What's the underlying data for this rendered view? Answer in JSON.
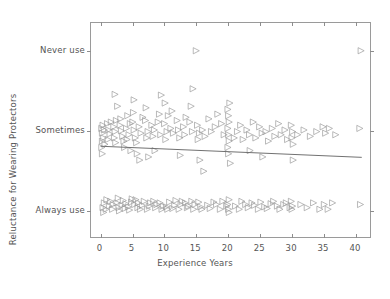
{
  "chart_data": {
    "type": "scatter",
    "title": "",
    "xlabel": "Experience Years",
    "ylabel": "Reluctance for Wearing Protectors",
    "xlim": [
      -1.5,
      42.5
    ],
    "ylim": [
      -0.35,
      2.35
    ],
    "xticks": [
      0,
      5,
      10,
      15,
      20,
      25,
      30,
      35,
      40
    ],
    "xticklabels": [
      "0",
      "5",
      "10",
      "15",
      "20",
      "25",
      "30",
      "35",
      "40"
    ],
    "yticks": [
      0,
      1,
      2
    ],
    "yticklabels": [
      "Always use",
      "Sometimes",
      "Never use"
    ],
    "grid": false,
    "legend": null,
    "marker": "right-triangle-open",
    "marker_color": "#9b9b9b",
    "marker_size": 6,
    "jitter": true,
    "fit_line": {
      "name": "linear regression",
      "color": "#6f6f6f",
      "x_start": 0,
      "x_end": 41.2,
      "y_start": 0.795,
      "y_end": 0.655,
      "slope": -0.0034,
      "intercept": 0.795
    },
    "points": [
      [
        0.1,
        1.02
      ],
      [
        0.2,
        0.96
      ],
      [
        0.3,
        1.06
      ],
      [
        0.4,
        0.9
      ],
      [
        0.5,
        1.0
      ],
      [
        0.2,
        0.86
      ],
      [
        0.6,
        0.82
      ],
      [
        0.1,
        0.78
      ],
      [
        0.5,
        0.08
      ],
      [
        0.3,
        0.02
      ],
      [
        0.8,
        0.0
      ],
      [
        0.4,
        -0.04
      ],
      [
        0.9,
        0.12
      ],
      [
        0.2,
        0.7
      ],
      [
        1.0,
        1.08
      ],
      [
        1.2,
        1.0
      ],
      [
        1.4,
        0.95
      ],
      [
        1.1,
        0.88
      ],
      [
        1.6,
        1.1
      ],
      [
        1.3,
        0.04
      ],
      [
        1.8,
        0.0
      ],
      [
        1.5,
        0.1
      ],
      [
        1.9,
        0.06
      ],
      [
        2.0,
        1.04
      ],
      [
        2.2,
        0.98
      ],
      [
        2.4,
        1.12
      ],
      [
        2.1,
        0.9
      ],
      [
        2.6,
        1.3
      ],
      [
        2.3,
        0.84
      ],
      [
        2.8,
        0.02
      ],
      [
        2.5,
        0.08
      ],
      [
        2.9,
        -0.02
      ],
      [
        2.7,
        0.14
      ],
      [
        2.2,
        1.45
      ],
      [
        3.0,
        1.06
      ],
      [
        3.2,
        0.99
      ],
      [
        3.4,
        0.92
      ],
      [
        3.1,
        1.14
      ],
      [
        3.6,
        0.86
      ],
      [
        3.3,
        0.05
      ],
      [
        3.8,
        0.01
      ],
      [
        3.5,
        0.11
      ],
      [
        3.9,
        0.07
      ],
      [
        3.7,
        0.78
      ],
      [
        4.0,
        1.02
      ],
      [
        4.2,
        1.18
      ],
      [
        4.4,
        0.94
      ],
      [
        4.1,
        0.88
      ],
      [
        4.6,
        1.08
      ],
      [
        4.3,
        0.03
      ],
      [
        4.8,
        0.09
      ],
      [
        4.5,
        -0.01
      ],
      [
        4.9,
        0.13
      ],
      [
        4.7,
        0.74
      ],
      [
        5.0,
        1.1
      ],
      [
        5.2,
        1.0
      ],
      [
        5.4,
        0.9
      ],
      [
        5.1,
        1.22
      ],
      [
        5.6,
        0.84
      ],
      [
        5.3,
        0.06
      ],
      [
        5.8,
        0.02
      ],
      [
        5.5,
        0.12
      ],
      [
        5.9,
        0.08
      ],
      [
        5.7,
        0.7
      ],
      [
        5.2,
        1.38
      ],
      [
        6.0,
        1.04
      ],
      [
        6.3,
        0.96
      ],
      [
        6.6,
        1.16
      ],
      [
        6.2,
        0.0
      ],
      [
        6.8,
        0.1
      ],
      [
        6.5,
        0.05
      ],
      [
        6.1,
        0.62
      ],
      [
        7.0,
        1.12
      ],
      [
        7.4,
        0.98
      ],
      [
        7.2,
        0.9
      ],
      [
        7.6,
        0.04
      ],
      [
        7.3,
        0.0
      ],
      [
        7.8,
        0.08
      ],
      [
        7.5,
        0.66
      ],
      [
        7.1,
        1.28
      ],
      [
        8.0,
        1.06
      ],
      [
        8.4,
        1.0
      ],
      [
        8.2,
        0.92
      ],
      [
        8.6,
        0.02
      ],
      [
        8.3,
        0.1
      ],
      [
        8.8,
        0.06
      ],
      [
        8.5,
        0.74
      ],
      [
        9.0,
        1.1
      ],
      [
        9.4,
        0.94
      ],
      [
        9.2,
        1.2
      ],
      [
        9.6,
        0.0
      ],
      [
        9.3,
        0.08
      ],
      [
        9.8,
        0.04
      ],
      [
        9.5,
        1.44
      ],
      [
        10.0,
        1.08
      ],
      [
        10.4,
        0.98
      ],
      [
        10.2,
        0.88
      ],
      [
        10.6,
        1.18
      ],
      [
        10.3,
        0.03
      ],
      [
        10.8,
        0.09
      ],
      [
        10.5,
        0.0
      ],
      [
        10.1,
        1.34
      ],
      [
        11.0,
        1.02
      ],
      [
        11.4,
        0.96
      ],
      [
        11.2,
        1.24
      ],
      [
        11.6,
        0.05
      ],
      [
        11.3,
        0.01
      ],
      [
        11.8,
        0.11
      ],
      [
        12.0,
        1.12
      ],
      [
        12.4,
        0.9
      ],
      [
        12.2,
        1.0
      ],
      [
        12.6,
        0.06
      ],
      [
        12.3,
        0.0
      ],
      [
        12.8,
        0.1
      ],
      [
        12.5,
        0.68
      ],
      [
        13.0,
        1.04
      ],
      [
        13.4,
        1.16
      ],
      [
        13.2,
        0.94
      ],
      [
        13.6,
        0.02
      ],
      [
        13.3,
        0.08
      ],
      [
        13.8,
        0.04
      ],
      [
        14.0,
        1.1
      ],
      [
        14.4,
        0.98
      ],
      [
        14.2,
        1.3
      ],
      [
        14.6,
        0.0
      ],
      [
        14.3,
        0.1
      ],
      [
        14.8,
        0.06
      ],
      [
        14.5,
        1.52
      ],
      [
        15.0,
        2.0
      ],
      [
        15.2,
        1.06
      ],
      [
        15.5,
        0.96
      ],
      [
        15.3,
        0.88
      ],
      [
        15.7,
        0.03
      ],
      [
        15.4,
        0.09
      ],
      [
        15.9,
        0.0
      ],
      [
        15.6,
        0.62
      ],
      [
        16.0,
        1.0
      ],
      [
        16.4,
        0.92
      ],
      [
        16.8,
        0.05
      ],
      [
        16.2,
        0.48
      ],
      [
        17.0,
        1.14
      ],
      [
        17.4,
        0.98
      ],
      [
        17.2,
        0.01
      ],
      [
        17.8,
        0.09
      ],
      [
        18.0,
        1.04
      ],
      [
        18.4,
        1.2
      ],
      [
        18.2,
        0.06
      ],
      [
        18.8,
        0.0
      ],
      [
        19.0,
        1.08
      ],
      [
        19.4,
        0.94
      ],
      [
        19.2,
        0.1
      ],
      [
        19.8,
        0.04
      ],
      [
        20.0,
        1.26
      ],
      [
        20.1,
        1.18
      ],
      [
        20.2,
        1.1
      ],
      [
        20.0,
        1.02
      ],
      [
        20.1,
        0.94
      ],
      [
        20.2,
        0.86
      ],
      [
        20.0,
        0.78
      ],
      [
        20.1,
        0.7
      ],
      [
        20.2,
        0.12
      ],
      [
        20.0,
        0.06
      ],
      [
        20.1,
        0.0
      ],
      [
        20.2,
        -0.04
      ],
      [
        20.3,
        1.34
      ],
      [
        20.4,
        0.58
      ],
      [
        21.0,
        0.9
      ],
      [
        21.5,
        0.98
      ],
      [
        21.2,
        0.04
      ],
      [
        21.8,
        0.0
      ],
      [
        22.0,
        1.06
      ],
      [
        22.4,
        0.88
      ],
      [
        22.2,
        0.1
      ],
      [
        22.8,
        0.06
      ],
      [
        23.0,
        1.0
      ],
      [
        23.4,
        0.94
      ],
      [
        23.2,
        0.02
      ],
      [
        23.8,
        0.08
      ],
      [
        23.5,
        0.74
      ],
      [
        24.0,
        1.1
      ],
      [
        24.4,
        0.9
      ],
      [
        24.2,
        0.05
      ],
      [
        24.8,
        0.0
      ],
      [
        25.0,
        1.04
      ],
      [
        25.4,
        0.96
      ],
      [
        25.2,
        0.09
      ],
      [
        25.8,
        0.03
      ],
      [
        25.5,
        0.66
      ],
      [
        26.0,
        0.98
      ],
      [
        26.4,
        0.86
      ],
      [
        26.2,
        0.01
      ],
      [
        26.8,
        0.07
      ],
      [
        27.0,
        1.02
      ],
      [
        27.4,
        0.92
      ],
      [
        27.2,
        0.1
      ],
      [
        27.8,
        0.04
      ],
      [
        28.0,
        1.08
      ],
      [
        28.4,
        0.94
      ],
      [
        28.2,
        0.0
      ],
      [
        28.8,
        0.06
      ],
      [
        29.0,
        1.0
      ],
      [
        29.4,
        0.88
      ],
      [
        29.2,
        0.08
      ],
      [
        29.8,
        0.02
      ],
      [
        30.0,
        1.06
      ],
      [
        30.2,
        0.98
      ],
      [
        30.1,
        0.9
      ],
      [
        30.3,
        0.82
      ],
      [
        30.0,
        0.1
      ],
      [
        30.2,
        0.04
      ],
      [
        30.1,
        0.0
      ],
      [
        30.3,
        0.62
      ],
      [
        31.0,
        0.94
      ],
      [
        31.5,
        0.06
      ],
      [
        32.0,
        1.0
      ],
      [
        32.5,
        0.02
      ],
      [
        33.0,
        0.92
      ],
      [
        33.5,
        0.08
      ],
      [
        34.0,
        0.98
      ],
      [
        34.5,
        0.0
      ],
      [
        35.0,
        1.04
      ],
      [
        35.4,
        0.96
      ],
      [
        35.2,
        0.06
      ],
      [
        35.8,
        0.0
      ],
      [
        36.0,
        1.02
      ],
      [
        36.5,
        0.08
      ],
      [
        37.0,
        0.94
      ],
      [
        40.8,
        1.02
      ],
      [
        40.9,
        0.06
      ],
      [
        41.0,
        2.0
      ]
    ]
  }
}
